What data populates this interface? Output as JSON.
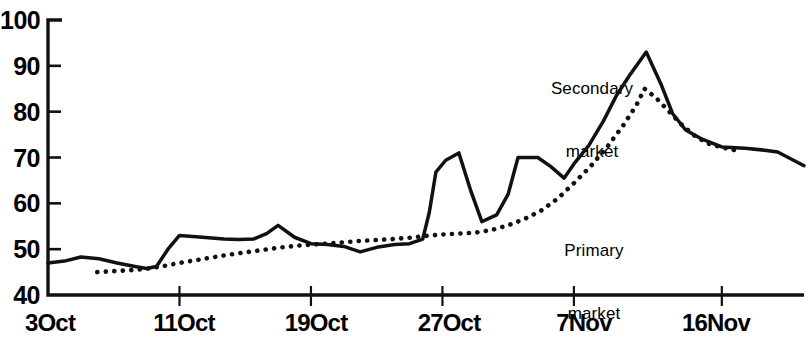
{
  "chart_data": {
    "type": "line",
    "title": "",
    "subtitle": "",
    "xlabel": "",
    "ylabel": "",
    "ylim": [
      40,
      100
    ],
    "yticks": [
      40,
      50,
      60,
      70,
      80,
      90,
      100
    ],
    "ytick_labels": [
      "40",
      "50",
      "60",
      "70",
      "80",
      "90",
      "100"
    ],
    "xtick_labels": [
      "3Oct",
      "11Oct",
      "19Oct",
      "27Oct",
      "7Nov",
      "16Nov"
    ],
    "xtick_days": [
      0,
      8,
      16,
      24,
      32,
      41
    ],
    "xlim_days": [
      0,
      46
    ],
    "grid": false,
    "legend_position": "inline-annotation",
    "annotations": [
      {
        "text": "Secondary\nmarket",
        "name": "secondary-market-label",
        "x_px": 592,
        "y_px": 40
      },
      {
        "text": "Primary\nmarket",
        "name": "primary-market-label",
        "x_px": 594,
        "y_px": 202
      }
    ],
    "series": [
      {
        "name": "Secondary market",
        "style": "solid",
        "color": "#111111",
        "points": [
          [
            0.0,
            47.0
          ],
          [
            1.0,
            47.4
          ],
          [
            2.0,
            48.3
          ],
          [
            3.1,
            47.9
          ],
          [
            4.2,
            47.0
          ],
          [
            5.3,
            46.2
          ],
          [
            6.0,
            45.8
          ],
          [
            6.6,
            46.2
          ],
          [
            7.3,
            50.0
          ],
          [
            8.0,
            53.0
          ],
          [
            9.4,
            52.6
          ],
          [
            10.7,
            52.2
          ],
          [
            11.6,
            52.1
          ],
          [
            12.5,
            52.2
          ],
          [
            13.3,
            53.4
          ],
          [
            14.0,
            55.2
          ],
          [
            15.0,
            52.6
          ],
          [
            16.0,
            51.2
          ],
          [
            17.0,
            51.0
          ],
          [
            18.0,
            50.6
          ],
          [
            19.0,
            49.4
          ],
          [
            20.0,
            50.4
          ],
          [
            21.1,
            51.0
          ],
          [
            22.0,
            51.2
          ],
          [
            22.8,
            52.2
          ],
          [
            23.2,
            58.0
          ],
          [
            23.6,
            66.8
          ],
          [
            24.2,
            69.4
          ],
          [
            25.0,
            71.0
          ],
          [
            25.7,
            63.0
          ],
          [
            26.4,
            56.0
          ],
          [
            27.3,
            57.5
          ],
          [
            28.0,
            62.0
          ],
          [
            28.6,
            70.0
          ],
          [
            29.8,
            70.0
          ],
          [
            30.6,
            68.0
          ],
          [
            31.4,
            65.5
          ],
          [
            32.0,
            68.6
          ],
          [
            32.9,
            72.6
          ],
          [
            33.8,
            78.0
          ],
          [
            34.6,
            83.6
          ],
          [
            35.4,
            88.0
          ],
          [
            36.4,
            93.0
          ],
          [
            37.3,
            86.0
          ],
          [
            38.0,
            79.6
          ],
          [
            38.8,
            76.0
          ],
          [
            39.8,
            74.0
          ],
          [
            41.0,
            72.3
          ],
          [
            42.4,
            72.0
          ],
          [
            43.6,
            71.6
          ],
          [
            44.4,
            71.2
          ],
          [
            46.0,
            68.2
          ]
        ]
      },
      {
        "name": "Primary market",
        "style": "dotted",
        "color": "#111111",
        "points": [
          [
            3.0,
            45.0
          ],
          [
            4.0,
            45.2
          ],
          [
            5.0,
            45.4
          ],
          [
            6.0,
            45.7
          ],
          [
            7.0,
            46.3
          ],
          [
            8.0,
            47.0
          ],
          [
            9.0,
            47.6
          ],
          [
            10.0,
            48.2
          ],
          [
            11.0,
            48.8
          ],
          [
            12.0,
            49.3
          ],
          [
            13.0,
            49.8
          ],
          [
            14.0,
            50.3
          ],
          [
            15.0,
            50.7
          ],
          [
            16.0,
            51.0
          ],
          [
            17.0,
            51.2
          ],
          [
            18.0,
            51.5
          ],
          [
            19.0,
            51.8
          ],
          [
            20.0,
            52.0
          ],
          [
            21.0,
            52.2
          ],
          [
            22.0,
            52.5
          ],
          [
            23.0,
            52.9
          ],
          [
            24.0,
            53.2
          ],
          [
            25.0,
            53.4
          ],
          [
            26.0,
            53.6
          ],
          [
            27.0,
            54.2
          ],
          [
            28.0,
            55.2
          ],
          [
            29.0,
            56.6
          ],
          [
            30.0,
            58.4
          ],
          [
            31.0,
            61.0
          ],
          [
            32.0,
            64.4
          ],
          [
            33.0,
            68.0
          ],
          [
            34.0,
            72.2
          ],
          [
            35.0,
            77.0
          ],
          [
            35.8,
            81.4
          ],
          [
            36.3,
            85.0
          ],
          [
            37.0,
            83.0
          ],
          [
            37.8,
            80.0
          ],
          [
            38.6,
            77.0
          ],
          [
            39.4,
            74.6
          ],
          [
            40.2,
            73.0
          ],
          [
            41.0,
            72.2
          ],
          [
            41.8,
            71.6
          ]
        ]
      }
    ]
  },
  "axis": {
    "y_tick_labels": [
      "100",
      "90",
      "80",
      "70",
      "60",
      "50",
      "40"
    ],
    "x_tick_labels": [
      "3Oct",
      "11Oct",
      "19Oct",
      "27Oct",
      "7Nov",
      "16Nov"
    ]
  },
  "labels": {
    "secondary_line1": "Secondary",
    "secondary_line2": "market",
    "primary_line1": "Primary",
    "primary_line2": "market"
  },
  "colors": {
    "ink": "#111111",
    "background": "#ffffff"
  }
}
